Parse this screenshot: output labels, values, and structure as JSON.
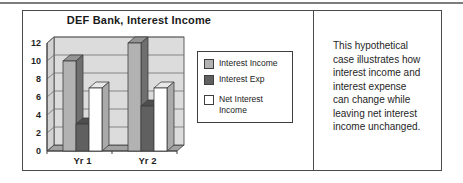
{
  "chart": {
    "title": "DEF Bank, Interest Income"
  },
  "chart_data": {
    "type": "bar",
    "style": "3d-column",
    "title": "DEF Bank, Interest Income",
    "categories": [
      "Yr 1",
      "Yr 2"
    ],
    "series": [
      {
        "name": "Interest Income",
        "values": [
          10,
          12
        ],
        "color": "#b2b2b2",
        "top": "#949494",
        "side": "#6f6f6f"
      },
      {
        "name": "Interest Exp",
        "values": [
          3,
          5
        ],
        "color": "#606060",
        "top": "#4e4e4e",
        "side": "#3c3c3c"
      },
      {
        "name": "Net Interest Income",
        "values": [
          7,
          7
        ],
        "color": "#ffffff",
        "top": "#e8e8e8",
        "side": "#aaaaaa"
      }
    ],
    "ylim": [
      0,
      12
    ],
    "ytick_step": 2,
    "yticks": [
      0,
      2,
      4,
      6,
      8,
      10,
      12
    ],
    "grid": true,
    "legend_position": "right",
    "xlabel": "",
    "ylabel": ""
  },
  "caption": {
    "text": "This hypothetical case illustrates how interest income and interest expense can change while leaving net interest income unchanged.",
    "lines": [
      "This hypothetical",
      "case illustrates how",
      "interest income and",
      "interest expense",
      "can change while",
      "leaving net interest",
      "income unchanged."
    ]
  },
  "colors": {
    "back_wall": "#dcdcdc",
    "left_wall": "#d2d2d2",
    "floor": "#a2a2a2",
    "grid": "#6f6f6f",
    "outline": "#3e3e3e",
    "frame_border": "#4a4a4a",
    "top_rule": "#7d7d7d",
    "text": "#1f1f1f"
  }
}
